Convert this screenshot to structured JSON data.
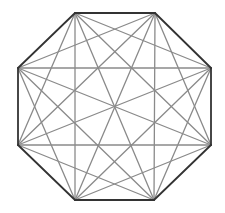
{
  "diagram": {
    "shape": "octagon",
    "vertices": [
      {
        "id": "A",
        "x": 75,
        "y": 13
      },
      {
        "id": "B",
        "x": 155,
        "y": 13
      },
      {
        "id": "C",
        "x": 211,
        "y": 68
      },
      {
        "id": "D",
        "x": 211,
        "y": 145
      },
      {
        "id": "E",
        "x": 154,
        "y": 200
      },
      {
        "id": "F",
        "x": 75,
        "y": 200
      },
      {
        "id": "G",
        "x": 18,
        "y": 145
      },
      {
        "id": "H",
        "x": 18,
        "y": 68
      }
    ],
    "edge_color": "#333333",
    "diagonal_color": "#8a8a8a",
    "background": "#ffffff"
  }
}
